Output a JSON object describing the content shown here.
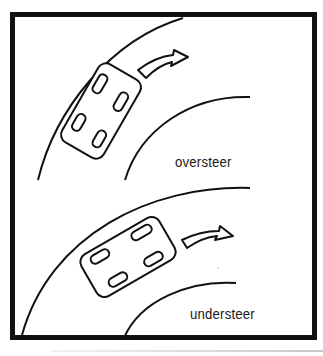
{
  "diagram": {
    "panels": [
      {
        "id": "oversteer",
        "label": "oversteer",
        "car_orientation": "rear sliding out, nose pointing into the corner",
        "arrow": "curved-arrow-right"
      },
      {
        "id": "understeer",
        "label": "understeer",
        "car_orientation": "front pushing wide, nose pointing outward",
        "arrow": "curved-arrow-right"
      }
    ],
    "colors": {
      "stroke": "#111111",
      "background": "#ffffff"
    }
  }
}
